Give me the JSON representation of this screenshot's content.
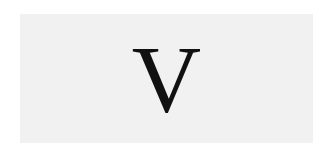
{
  "card": {
    "letter": "V"
  },
  "colors": {
    "background": "#ffffff",
    "panel": "#f1f1f1",
    "text": "#111111"
  }
}
